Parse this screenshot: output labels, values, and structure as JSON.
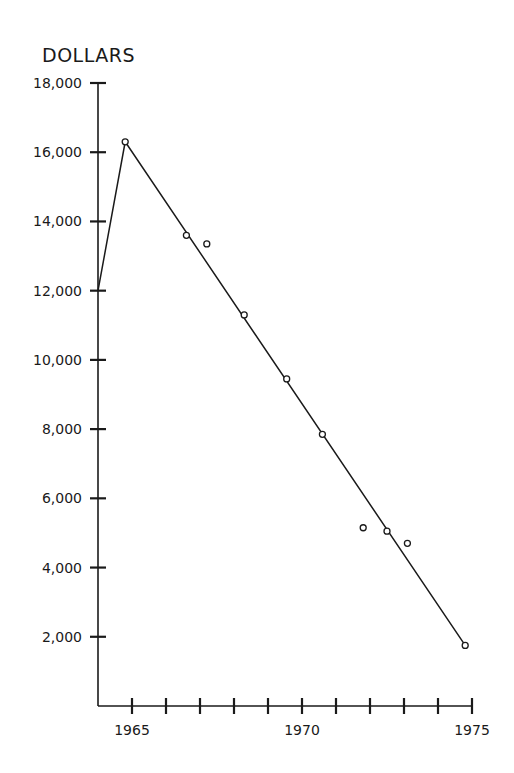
{
  "chart_data": {
    "type": "line",
    "title": "",
    "xlabel": "",
    "ylabel": "DOLLARS",
    "xlim": [
      1964,
      1975
    ],
    "ylim": [
      0,
      18000
    ],
    "grid": false,
    "legend": null,
    "x_ticks": [
      1964,
      1965,
      1966,
      1967,
      1968,
      1969,
      1970,
      1971,
      1972,
      1973,
      1974,
      1975
    ],
    "x_tick_labels": [
      {
        "value": 1965,
        "label": "1965"
      },
      {
        "value": 1970,
        "label": "1970"
      },
      {
        "value": 1975,
        "label": "1975"
      }
    ],
    "y_ticks": [
      {
        "value": 2000,
        "label": "2,000"
      },
      {
        "value": 4000,
        "label": "4,000"
      },
      {
        "value": 6000,
        "label": "6,000"
      },
      {
        "value": 8000,
        "label": "8,000"
      },
      {
        "value": 10000,
        "label": "10,000"
      },
      {
        "value": 12000,
        "label": "12,000"
      },
      {
        "value": 14000,
        "label": "14,000"
      },
      {
        "value": 16000,
        "label": "16,000"
      },
      {
        "value": 18000,
        "label": "18,000"
      }
    ],
    "series": [
      {
        "name": "observed",
        "marker": "open-circle",
        "points": [
          {
            "x": 1964.8,
            "y": 16300
          },
          {
            "x": 1966.6,
            "y": 13600
          },
          {
            "x": 1967.2,
            "y": 13350
          },
          {
            "x": 1968.3,
            "y": 11300
          },
          {
            "x": 1969.55,
            "y": 9450
          },
          {
            "x": 1970.6,
            "y": 7850
          },
          {
            "x": 1971.8,
            "y": 5150
          },
          {
            "x": 1972.5,
            "y": 5050
          },
          {
            "x": 1973.1,
            "y": 4700
          },
          {
            "x": 1974.8,
            "y": 1750
          }
        ]
      },
      {
        "name": "trend-line",
        "marker": "none",
        "points": [
          {
            "x": 1964.0,
            "y": 12000
          },
          {
            "x": 1964.8,
            "y": 16300
          },
          {
            "x": 1974.8,
            "y": 1750
          }
        ]
      }
    ]
  },
  "labels": {
    "y_axis_title": "DOLLARS"
  }
}
